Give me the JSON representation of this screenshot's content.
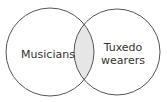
{
  "diagram": {
    "type": "venn",
    "sets": [
      {
        "label": "Musicians"
      },
      {
        "label_line1": "Tuxedo",
        "label_line2": "wearers"
      }
    ],
    "intersection_fill": "#e6e6e6",
    "stroke_color": "#555555"
  }
}
